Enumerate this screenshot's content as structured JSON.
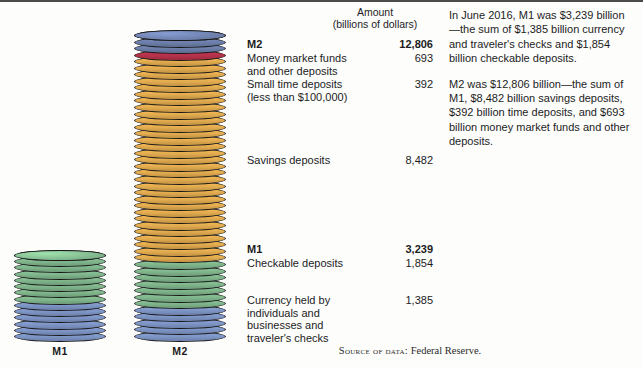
{
  "figure": {
    "title_hidden": "",
    "source_prefix": "Source of data:",
    "source_value": "Federal Reserve."
  },
  "amount_header": {
    "line1": "Amount",
    "line2": "(billions of dollars)"
  },
  "axis_labels": {
    "m1": "M1",
    "m2": "M2"
  },
  "rows": [
    {
      "name": "M2",
      "amount": "12,806",
      "bold": true
    },
    {
      "name": "Money market funds and other deposits",
      "amount": "693",
      "bold": false
    },
    {
      "name": "Small time deposits (less than $100,000)",
      "amount": "392",
      "bold": false
    },
    {
      "name": "Savings deposits",
      "amount": "8,482",
      "bold": false
    },
    {
      "name": "M1",
      "amount": "3,239",
      "bold": true
    },
    {
      "name": "Checkable deposits",
      "amount": "1,854",
      "bold": false
    },
    {
      "name": "Currency held by individuals and businesses and traveler's checks",
      "amount": "1,385",
      "bold": false
    }
  ],
  "narrative": {
    "paragraph1": "In June 2016, M1 was $3,239 billion—the sum of $1,385 billion currency and traveler's checks and $1,854 billion checkable deposits.",
    "paragraph2": "M2 was $12,806 billion—the sum of M1, $8,482 billion savings deposits, $392 billion time deposits, and $693 billion money market funds and other deposits."
  },
  "colors": {
    "currency_blue": "#7d94c4",
    "checkable_green": "#7fb48b",
    "savings_orange": "#e0aa4e",
    "time_deposits_red": "#b4324a",
    "money_market_navy": "#6b7da8",
    "disk_outline": "#161616",
    "border": "#4b4b4b"
  },
  "chart_data": {
    "type": "bar",
    "title": "",
    "subtitle": "",
    "xlabel": "",
    "ylabel": "Amount (billions of dollars)",
    "categories": [
      "M1",
      "M2"
    ],
    "totals": [
      3239,
      12806
    ],
    "ylim": [
      0,
      12806
    ],
    "grid": false,
    "legend": "right-of-chart labels",
    "series": [
      {
        "name": "Currency held by individuals and businesses and traveler's checks",
        "color": "#7d94c4",
        "values": [
          1385,
          1385
        ]
      },
      {
        "name": "Checkable deposits",
        "color": "#7fb48b",
        "values": [
          1854,
          1854
        ]
      },
      {
        "name": "Savings deposits",
        "color": "#e0aa4e",
        "values": [
          0,
          8482
        ]
      },
      {
        "name": "Small time deposits (less than $100,000)",
        "color": "#b4324a",
        "values": [
          0,
          392
        ]
      },
      {
        "name": "Money market funds and other deposits",
        "color": "#6b7da8",
        "values": [
          0,
          693
        ]
      }
    ],
    "annotations": [
      "M1 = currency + checkable deposits = 3,239",
      "M2 = M1 + savings + small time deposits + money market funds = 12,806"
    ]
  }
}
